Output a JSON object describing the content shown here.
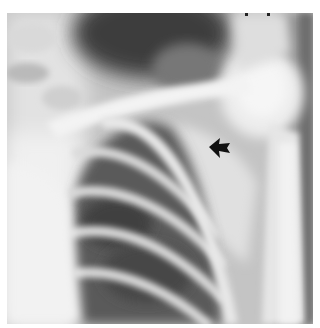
{
  "image": {
    "type": "radiograph",
    "description": "Chest X-ray, right shoulder / upper thorax region showing clavicle, ribs, humeral head and scapula",
    "annotation": {
      "type": "arrow",
      "direction": "left",
      "color": "#111111",
      "position": {
        "x": 222,
        "y": 147
      }
    },
    "colors": {
      "background": "#ffffff",
      "bone": "#ececec",
      "soft_tissue": "#bdbdbd",
      "lung_dark": "#4a4a4a"
    }
  }
}
